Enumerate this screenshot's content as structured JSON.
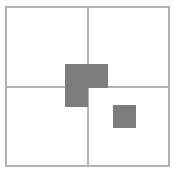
{
  "canvas": {
    "width": 173,
    "height": 171,
    "background": "#ffffff"
  },
  "colors": {
    "line": "#b2b2b2",
    "shape_fill": "#7c7c7c",
    "background": "#ffffff"
  },
  "frame": {
    "name": "outer-square-frame",
    "x": 6,
    "y": 7,
    "width": 163,
    "height": 159
  },
  "dividers": [
    {
      "name": "vertical-divider-line",
      "x1": 88,
      "y1": 7,
      "x2": 88,
      "y2": 166
    },
    {
      "name": "horizontal-divider-line",
      "x1": 6,
      "y1": 87,
      "x2": 169,
      "y2": 87
    }
  ],
  "shapes": [
    {
      "name": "center-l-shape",
      "type": "polygon",
      "points": "65,64 108,64 108,88 88,88 88,107 65,107"
    },
    {
      "name": "small-square",
      "type": "rect",
      "x": 113,
      "y": 105,
      "width": 23,
      "height": 23
    }
  ]
}
